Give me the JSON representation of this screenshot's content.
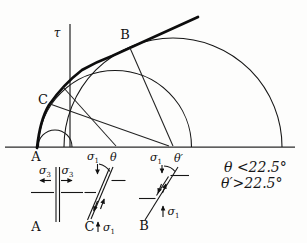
{
  "mohr": {
    "tau_axis_label": "τ",
    "label_A": "A",
    "label_B": "B",
    "label_C": "C"
  },
  "elements": {
    "a": {
      "caption": "A",
      "sigma3_left_sym": "σ",
      "sigma3_left_sub": "3",
      "sigma3_right_sym": "σ",
      "sigma3_right_sub": "3"
    },
    "c": {
      "caption": "C",
      "sigma1_top_sym": "σ",
      "sigma1_top_sub": "1",
      "theta": "θ",
      "sigma1_bottom_sym": "σ",
      "sigma1_bottom_sub": "1"
    },
    "b": {
      "caption": "B",
      "sigma1_top_sym": "σ",
      "sigma1_top_sub": "1",
      "theta_prime": "θ′",
      "sigma1_bottom_sym": "σ",
      "sigma1_bottom_sub": "1"
    }
  },
  "annotations": {
    "line1": "θ <22.5°",
    "line2": "θ′>22.5°"
  }
}
